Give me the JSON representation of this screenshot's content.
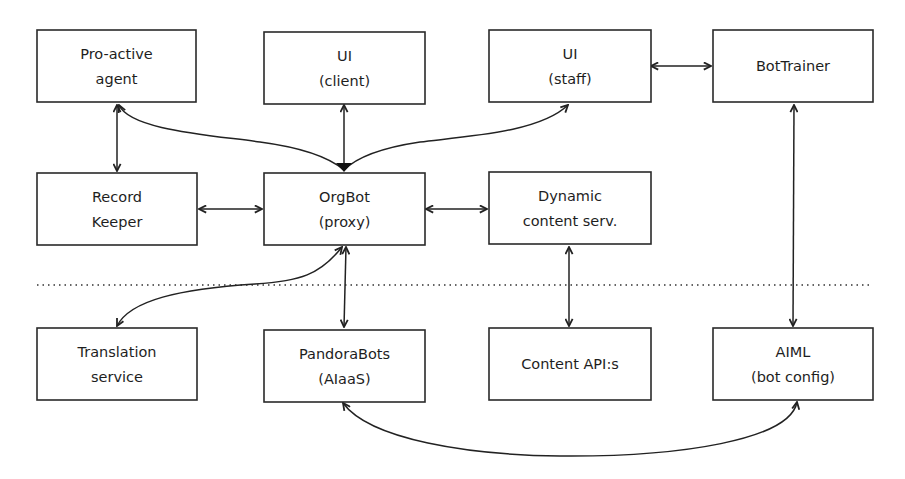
{
  "nodes": [
    {
      "id": "proactive",
      "lines": [
        "Pro-active",
        "agent"
      ]
    },
    {
      "id": "ui_client",
      "lines": [
        "UI",
        "(client)"
      ]
    },
    {
      "id": "ui_staff",
      "lines": [
        "UI",
        "(staff)"
      ]
    },
    {
      "id": "bottrainer",
      "lines": [
        "BotTrainer"
      ]
    },
    {
      "id": "recordkeeper",
      "lines": [
        "Record",
        "Keeper"
      ]
    },
    {
      "id": "orgbot",
      "lines": [
        "OrgBot",
        "(proxy)"
      ]
    },
    {
      "id": "dynamic",
      "lines": [
        "Dynamic",
        "content serv."
      ]
    },
    {
      "id": "translation",
      "lines": [
        "Translation",
        "service"
      ]
    },
    {
      "id": "pandorabots",
      "lines": [
        "PandoraBots",
        "(AIaaS)"
      ]
    },
    {
      "id": "contentapi",
      "lines": [
        "Content API:s"
      ]
    },
    {
      "id": "aiml",
      "lines": [
        "AIML",
        "(bot config)"
      ]
    }
  ],
  "edges": [
    {
      "from": "ui_staff",
      "to": "bottrainer",
      "direction": "both"
    },
    {
      "from": "proactive",
      "to": "recordkeeper",
      "direction": "both"
    },
    {
      "from": "proactive",
      "to": "orgbot",
      "direction": "both"
    },
    {
      "from": "ui_client",
      "to": "orgbot",
      "direction": "both"
    },
    {
      "from": "ui_staff",
      "to": "orgbot",
      "direction": "both"
    },
    {
      "from": "recordkeeper",
      "to": "orgbot",
      "direction": "both"
    },
    {
      "from": "orgbot",
      "to": "dynamic",
      "direction": "both"
    },
    {
      "from": "bottrainer",
      "to": "aiml",
      "direction": "both"
    },
    {
      "from": "orgbot",
      "to": "translation",
      "direction": "both"
    },
    {
      "from": "orgbot",
      "to": "pandorabots",
      "direction": "both"
    },
    {
      "from": "dynamic",
      "to": "contentapi",
      "direction": "both"
    },
    {
      "from": "pandorabots",
      "to": "aiml",
      "direction": "both"
    }
  ],
  "separator": {
    "style": "dotted",
    "meaning": "boundary between internal components and external services"
  }
}
